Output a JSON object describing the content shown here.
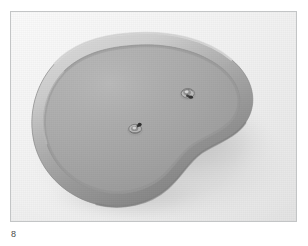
{
  "page": {
    "background_color": "#ffffff",
    "media_type": "black-and-white photograph"
  },
  "figure": {
    "caption_number": "8",
    "frame": {
      "border_color": "#c3c5c6",
      "x": 10,
      "y": 11,
      "width": 287,
      "height": 211
    },
    "photo": {
      "background_color": "#eeeeee",
      "alt_description": "Black and white photograph of a kidney-shaped shallow tray with a raised rolled rim, viewed at an angle, resting on a plain light background. Two small metal fittings are mounted on its upper surface.",
      "subject": {
        "name": "kidney-shaped tray",
        "shape": "kidney / bean outline with concave notch on the right side",
        "surface_color": "#a9a9a9",
        "rim_highlight_color": "#c6c6c6",
        "rim_shadow_color": "#8e8e8e",
        "cast_shadow_color": "#b5b5b5",
        "fittings": [
          {
            "label": "metal fitting left",
            "x_pct": 43.5,
            "y_pct": 56.0
          },
          {
            "label": "metal fitting right",
            "x_pct": 62.0,
            "y_pct": 38.0
          }
        ]
      }
    }
  }
}
